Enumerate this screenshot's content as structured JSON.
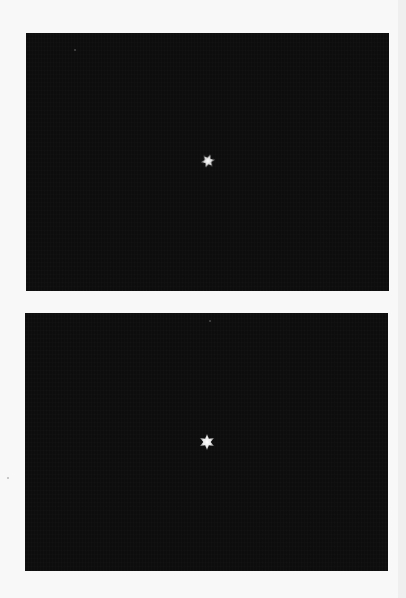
{
  "frames": [
    {
      "id": "top",
      "background": "#0d0d0d",
      "star": {
        "x": 182,
        "y": 128,
        "size": 14,
        "color": "#d8d8d8",
        "rotation": 20
      },
      "specks": [
        {
          "x": 48,
          "y": 16
        }
      ]
    },
    {
      "id": "bottom",
      "background": "#0d0d0d",
      "star": {
        "x": 182,
        "y": 129,
        "size": 16,
        "color": "#e6e6e6",
        "rotation": 0
      },
      "specks": [
        {
          "x": 184,
          "y": 7
        }
      ]
    }
  ],
  "colors": {
    "page_background": "#f8f8f8",
    "frame_background": "#0d0d0d",
    "star": "#e0e0e0"
  }
}
